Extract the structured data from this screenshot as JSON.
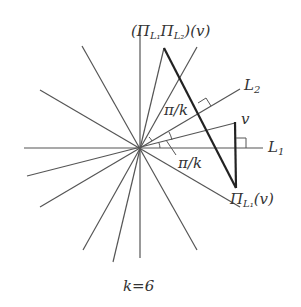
{
  "diagram": {
    "type": "reflection-lines",
    "center": [
      140,
      148
    ],
    "colors": {
      "thin_line": "#555555",
      "thick_line": "#222222",
      "text": "#333333"
    },
    "labels": {
      "composite": "(Π",
      "composite_sub1": "L₁",
      "composite_mid": "Π",
      "composite_sub2": "L₂",
      "composite_tail": ")(v)",
      "L2": "L",
      "L2_sub": "2",
      "L1": "L",
      "L1_sub": "1",
      "v": "v",
      "proj": "Π",
      "proj_sub": "L₁",
      "proj_tail": "(v)",
      "angle_upper": "π/k",
      "angle_lower": "π/k",
      "caption": "k=6"
    }
  }
}
